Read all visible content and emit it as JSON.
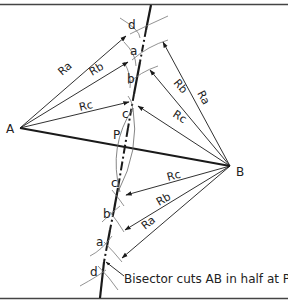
{
  "diagram": {
    "points": {
      "A": {
        "label": "A",
        "x": 20,
        "y": 128
      },
      "B": {
        "label": "B",
        "x": 230,
        "y": 166
      },
      "P": {
        "label": "P",
        "x": 125,
        "y": 146
      }
    },
    "radius_labels": {
      "Ra": "Ra",
      "Rb": "Rb",
      "Rc": "Rc"
    },
    "arc_labels": {
      "top": [
        "d",
        "a",
        "b",
        "c"
      ],
      "bottom": [
        "c",
        "b",
        "a",
        "d"
      ]
    },
    "caption": "Bisector cuts AB in half at P",
    "colors": {
      "line": "#1a1a1a",
      "thin": "#333333",
      "arc": "#777777",
      "border": "#444444"
    }
  }
}
